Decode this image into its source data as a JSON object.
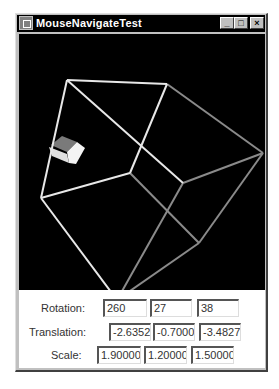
{
  "window": {
    "title": "MouseNavigateTest",
    "buttons": {
      "minimize": "_",
      "maximize": "□",
      "close": "×"
    }
  },
  "scene": {
    "background": "#000000",
    "wire_cube": {
      "vertices": {
        "A": [
          48,
          46
        ],
        "B": [
          148,
          50
        ],
        "C": [
          244,
          119
        ],
        "D": [
          22,
          164
        ],
        "E": [
          111,
          139
        ],
        "F": [
          164,
          149
        ],
        "G": [
          180,
          209
        ],
        "H": [
          98,
          266
        ]
      },
      "bright_color": "#e8e8e8",
      "dim_color": "#8a8a8a"
    },
    "small_cube": {
      "top_color": "#7a7a7a",
      "front_color": "#f0f0f0",
      "side_color": "#cfcfcf"
    }
  },
  "controls": {
    "rotation": {
      "label": "Rotation:",
      "values": [
        "260",
        "27",
        "38"
      ]
    },
    "translation": {
      "label": "Translation:",
      "values": [
        "-2.63520",
        "-0.70009",
        "-3.48274"
      ]
    },
    "scale": {
      "label": "Scale:",
      "values": [
        "1.90000",
        "1.20000",
        "1.50000"
      ]
    }
  }
}
